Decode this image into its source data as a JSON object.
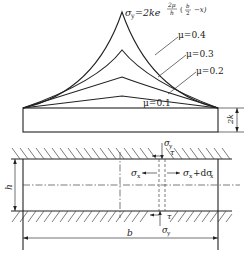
{
  "figure": {
    "formula": {
      "lhs": "σ",
      "lhs_sub": "y",
      "rhs_base": "=2ke",
      "exponent": "2μ",
      "exponent_den": "h",
      "paren": "(",
      "frac_num": "b",
      "frac_den": "2",
      "tail": "−x)"
    },
    "curves": [
      {
        "label": "μ=0.4",
        "mu": 0.4
      },
      {
        "label": "μ=0.3",
        "mu": 0.3
      },
      {
        "label": "μ=0.2",
        "mu": 0.2
      },
      {
        "label": "μ=0.1",
        "mu": 0.1
      }
    ],
    "dimensions": {
      "base_height": "2k",
      "gap_height": "h",
      "width": "b"
    },
    "stresses": {
      "sigma_y_top": "σ",
      "sigma_y_top_sub": "y",
      "tau_top": "τ",
      "sigma_x_left": "σ",
      "sigma_x_left_sub": "x",
      "sigma_x_right": "σ",
      "sigma_x_right_sub": "x",
      "sigma_x_right_tail": "+dσ",
      "sigma_x_right_tail_sub": "x",
      "tau_bottom": "τ",
      "sigma_y_bottom": "σ",
      "sigma_y_bottom_sub": "y"
    }
  }
}
